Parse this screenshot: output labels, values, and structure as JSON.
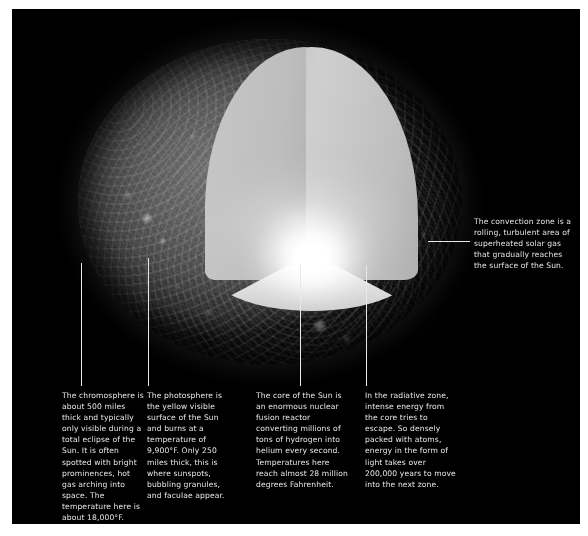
{
  "figure": {
    "background_color": "#000000",
    "page_color": "#ffffff",
    "text_color": "#e6e6e6",
    "leader_line_color": "#e8e8e8"
  },
  "sun": {
    "surface_label": "solar disc",
    "cutaway_label": "cutaway wedge",
    "core_glow_label": "core glow"
  },
  "callouts": [
    {
      "id": "chromosphere",
      "text": "The chromosphere is about 500 miles thick and typically only visible during a total eclipse of the Sun. It is often spotted with bright prominences, hot gas arching into space. The temperature here is about 18,000°F.",
      "line": {
        "x": 81,
        "y1": 263,
        "y2": 386
      },
      "box": {
        "x": 62,
        "y": 390,
        "width": 84
      }
    },
    {
      "id": "photosphere",
      "text": "The photosphere is the yellow visible surface of the Sun and burns at a temperature of 9,900°F. Only 250 miles thick, this is where sunspots, bubbling granules, and faculae appear.",
      "line": {
        "x": 148,
        "y1": 258,
        "y2": 386
      },
      "box": {
        "x": 147,
        "y": 390,
        "width": 88
      }
    },
    {
      "id": "core",
      "text": "The core of the Sun is an enormous nuclear fusion reactor converting millions of tons of hydrogen into helium every second. Temperatures here reach almost 28 million degrees Fahrenheit.",
      "line": {
        "x": 300,
        "y1": 265,
        "y2": 386
      },
      "box": {
        "x": 256,
        "y": 390,
        "width": 92
      }
    },
    {
      "id": "radiative-zone",
      "text": "In the radiative zone, intense energy from the core tries to escape. So densely packed with atoms, energy in the form of light takes over 200,000 years to move into the next zone.",
      "line": {
        "x": 366,
        "y1": 265,
        "y2": 386
      },
      "box": {
        "x": 365,
        "y": 390,
        "width": 92
      }
    },
    {
      "id": "convection-zone",
      "text": "The convection zone is a rolling, turbulent area of superheated solar gas that gradually reaches the surface of the Sun.",
      "line": {
        "x1": 428,
        "x2": 470,
        "y": 241
      },
      "box": {
        "x": 474,
        "y": 216,
        "width": 98
      }
    }
  ]
}
